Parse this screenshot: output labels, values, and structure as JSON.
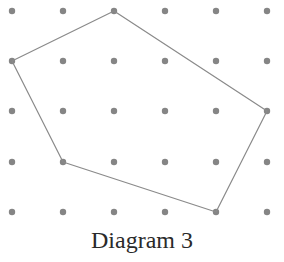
{
  "diagram": {
    "caption": "Diagram 3",
    "grid": {
      "columns": 6,
      "rows": 5,
      "x_positions": [
        12,
        63,
        114,
        165,
        216,
        267
      ],
      "y_positions": [
        11,
        61,
        111,
        162,
        212
      ],
      "dot_radius": 3.2,
      "dot_color": "#858585"
    },
    "polygon": {
      "type": "pentagon",
      "stroke_color": "#8a8a8a",
      "stroke_width": 1.2,
      "vertices_grid": [
        [
          2,
          0
        ],
        [
          5,
          2
        ],
        [
          4,
          4
        ],
        [
          1,
          3
        ],
        [
          0,
          1
        ]
      ]
    }
  }
}
